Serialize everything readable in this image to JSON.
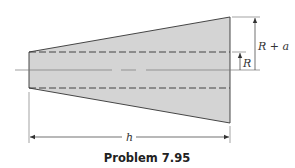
{
  "figure": {
    "caption": "Problem 7.95",
    "shape": "truncated cone (frustum) cross-section with cylindrical bore",
    "labels": {
      "outer_radius": "R + a",
      "inner_radius": "R",
      "length": "h"
    },
    "colors": {
      "fill": "#d4d4d4",
      "stroke": "#333333",
      "background": "#ffffff"
    }
  }
}
